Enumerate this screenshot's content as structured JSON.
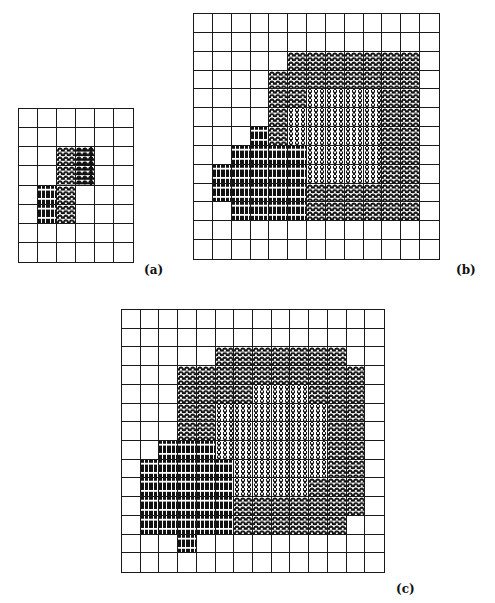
{
  "figure": {
    "panels": [
      {
        "id": "a",
        "label": "(a)",
        "cols": 6,
        "rows": 8,
        "cells": [
          "......",
          "......",
          "..AH..",
          "..AH..",
          ".BA...",
          ".BA...",
          "......",
          "......"
        ]
      },
      {
        "id": "b",
        "label": "(b)",
        "cols": 13,
        "rows": 13,
        "cells": [
          ".............",
          ".............",
          ".....AAAAAAA.",
          "....AAAAAAAA.",
          "....AAPPPPAA.",
          "....APPPPPAA.",
          "...BAPPPPPAA.",
          "..BBBBPPPPAA.",
          ".BBBBBPPPPAA.",
          ".BBBBBAAAAAA.",
          "..BBBBAAAAAA.",
          ".............",
          "............."
        ]
      },
      {
        "id": "c",
        "label": "(c)",
        "cols": 14,
        "rows": 14,
        "cells": [
          "..............",
          "..............",
          ".....AAAAAAA..",
          "...AAAAAAAAAA.",
          "...AAAAPPPAAA.",
          "...AAPPPPPPAA.",
          "...AAPPPPPPAA.",
          "..BBBPPPPPPAA.",
          ".BBBBBPPPPPAA.",
          ".BBBBBPPPPAAA.",
          ".BBBBBAAAAAAA.",
          ".BBBBBAAAAAA..",
          "...B..........",
          ".............."
        ]
      }
    ],
    "legend_codes": {
      ".": "empty",
      "A": "arch-texture",
      "P": "pillar-texture",
      "B": "brick-texture",
      "H": "mixed-arch-pillar-texture"
    }
  }
}
